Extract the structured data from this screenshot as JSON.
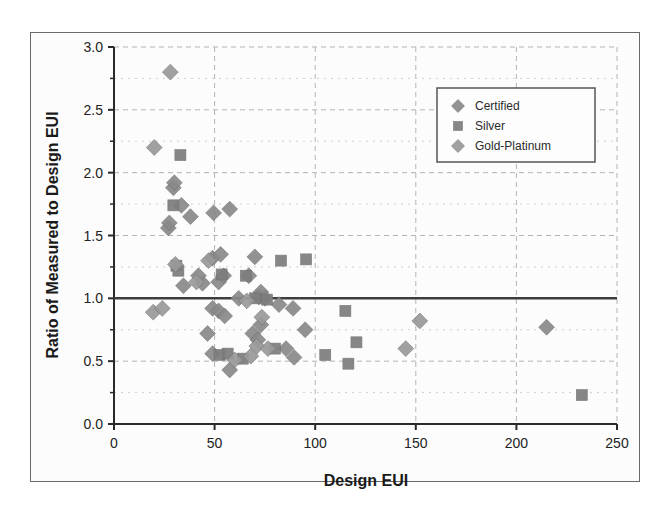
{
  "chart_data": {
    "type": "scatter",
    "title": "",
    "xlabel": "Design EUI",
    "ylabel": "Ratio of Measured to Design EUI",
    "xlim": [
      0,
      250
    ],
    "ylim": [
      0.0,
      3.0
    ],
    "xticks": [
      "0",
      "50",
      "100",
      "150",
      "200",
      "250"
    ],
    "xtick_values": [
      0,
      50,
      100,
      150,
      200,
      250
    ],
    "yticks": [
      "0.0",
      "0.5",
      "1.0",
      "1.5",
      "2.0",
      "2.5",
      "3.0"
    ],
    "ytick_values": [
      0.0,
      0.5,
      1.0,
      1.5,
      2.0,
      2.5,
      3.0
    ],
    "grid": true,
    "grid_style": "dashed",
    "legend_position": "top-right",
    "reference_line": {
      "y": 1.0,
      "color": "#3d3d3d",
      "width": 2.5
    },
    "series": [
      {
        "name": "Certified",
        "marker": "diamond",
        "color": "#8a8a8a",
        "points": [
          [
            49.0,
            1.32
          ],
          [
            53.0,
            1.35
          ],
          [
            70.0,
            1.33
          ],
          [
            33.5,
            1.74
          ],
          [
            38.0,
            1.65
          ],
          [
            49.5,
            1.68
          ],
          [
            57.5,
            1.71
          ],
          [
            29.5,
            1.88
          ],
          [
            30.0,
            1.92
          ],
          [
            27.0,
            1.56
          ],
          [
            27.5,
            1.6
          ],
          [
            44.0,
            1.12
          ],
          [
            42.0,
            1.18
          ],
          [
            34.5,
            1.1
          ],
          [
            52.0,
            1.13
          ],
          [
            54.5,
            1.18
          ],
          [
            67.0,
            1.18
          ],
          [
            73.0,
            1.05
          ],
          [
            62.0,
            1.0
          ],
          [
            72.0,
            1.01
          ],
          [
            75.0,
            1.0
          ],
          [
            49.0,
            0.92
          ],
          [
            52.0,
            0.9
          ],
          [
            55.0,
            0.86
          ],
          [
            82.0,
            0.95
          ],
          [
            89.0,
            0.92
          ],
          [
            69.0,
            0.72
          ],
          [
            71.5,
            0.67
          ],
          [
            73.0,
            0.79
          ],
          [
            46.5,
            0.72
          ],
          [
            95.0,
            0.75
          ],
          [
            85.5,
            0.6
          ],
          [
            89.5,
            0.53
          ],
          [
            57.5,
            0.43
          ],
          [
            49.0,
            0.56
          ],
          [
            215.0,
            0.77
          ]
        ]
      },
      {
        "name": "Silver",
        "marker": "square",
        "color": "#7d7d7d",
        "points": [
          [
            33.0,
            2.14
          ],
          [
            29.5,
            1.74
          ],
          [
            31.0,
            1.26
          ],
          [
            32.0,
            1.22
          ],
          [
            83.0,
            1.3
          ],
          [
            95.5,
            1.31
          ],
          [
            53.5,
            1.19
          ],
          [
            65.5,
            1.18
          ],
          [
            70.0,
            1.0
          ],
          [
            76.0,
            0.99
          ],
          [
            115.0,
            0.9
          ],
          [
            52.5,
            0.55
          ],
          [
            56.5,
            0.56
          ],
          [
            64.0,
            0.52
          ],
          [
            80.0,
            0.6
          ],
          [
            120.5,
            0.65
          ],
          [
            105.0,
            0.55
          ],
          [
            116.5,
            0.48
          ],
          [
            232.5,
            0.23
          ]
        ]
      },
      {
        "name": "Gold-Platinum",
        "marker": "diamond",
        "color": "#9a9a9a",
        "points": [
          [
            28.0,
            2.8
          ],
          [
            20.0,
            2.2
          ],
          [
            30.5,
            1.27
          ],
          [
            19.5,
            0.89
          ],
          [
            24.0,
            0.92
          ],
          [
            41.0,
            1.13
          ],
          [
            47.0,
            1.3
          ],
          [
            66.0,
            0.98
          ],
          [
            73.5,
            0.85
          ],
          [
            71.0,
            0.62
          ],
          [
            76.5,
            0.6
          ],
          [
            68.0,
            0.54
          ],
          [
            152.0,
            0.82
          ],
          [
            145.0,
            0.6
          ],
          [
            60.0,
            0.51
          ]
        ]
      }
    ]
  },
  "legend": {
    "entries": [
      {
        "label": "Certified",
        "marker": "diamond"
      },
      {
        "label": "Silver",
        "marker": "square"
      },
      {
        "label": "Gold-Platinum",
        "marker": "diamond"
      }
    ]
  },
  "colors": {
    "marker_certified": "#8a8a8a",
    "marker_silver": "#7d7d7d",
    "marker_gold_platinum": "#9a9a9a",
    "axis": "#2a2a2a",
    "grid": "#b4b4b4",
    "reference_line": "#3d3d3d",
    "plot_background": "#fcfcfc",
    "frame": "#6a6a6a"
  }
}
